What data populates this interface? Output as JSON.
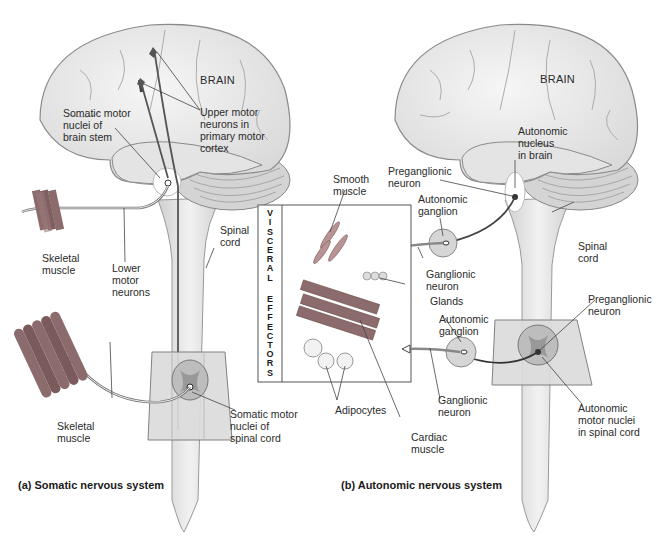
{
  "figure": {
    "panel_a": {
      "caption": "(a) Somatic nervous system",
      "labels": {
        "brain": "BRAIN",
        "somatic_motor_nuclei_brain_stem": "Somatic motor\nnuclei of\nbrain stem",
        "upper_motor_neurons": "Upper motor\nneurons in\nprimary motor\ncortex",
        "skeletal_muscle_top": "Skeletal\nmuscle",
        "lower_motor_neurons": "Lower\nmotor\nneurons",
        "spinal_cord": "Spinal\ncord",
        "skeletal_muscle_bottom": "Skeletal\nmuscle",
        "somatic_motor_nuclei_spinal_cord": "Somatic motor\nnuclei of\nspinal cord"
      }
    },
    "panel_b": {
      "caption": "(b) Autonomic nervous system",
      "labels": {
        "brain": "BRAIN",
        "autonomic_nucleus_brain": "Autonomic\nnucleus\nin brain",
        "preganglionic_neuron_top": "Preganglionic\nneuron",
        "smooth_muscle": "Smooth\nmuscle",
        "autonomic_ganglion_top": "Autonomic\nganglion",
        "ganglionic_neuron_top": "Ganglionic\nneuron",
        "glands": "Glands",
        "spinal_cord": "Spinal\ncord",
        "preganglionic_neuron_bottom": "Preganglionic\nneuron",
        "autonomic_ganglion_bottom": "Autonomic\nganglion",
        "ganglionic_neuron_bottom": "Ganglionic\nneuron",
        "adipocytes": "Adipocytes",
        "cardiac_muscle": "Cardiac\nmuscle",
        "autonomic_motor_nuclei_spinal_cord": "Autonomic\nmotor nuclei\nin spinal cord"
      },
      "visceral_effectors_box_title": [
        "V",
        "I",
        "S",
        "C",
        "E",
        "R",
        "A",
        "L",
        "",
        "E",
        "F",
        "F",
        "E",
        "C",
        "T",
        "O",
        "R",
        "S"
      ]
    },
    "colors": {
      "brain_fill": "#ececec",
      "brain_stroke": "#8a8a8a",
      "cord_fill": "#e6e6e6",
      "muscle": "#8b6b6b",
      "nerve": "#555555",
      "plane": "#d9d9d9"
    }
  }
}
